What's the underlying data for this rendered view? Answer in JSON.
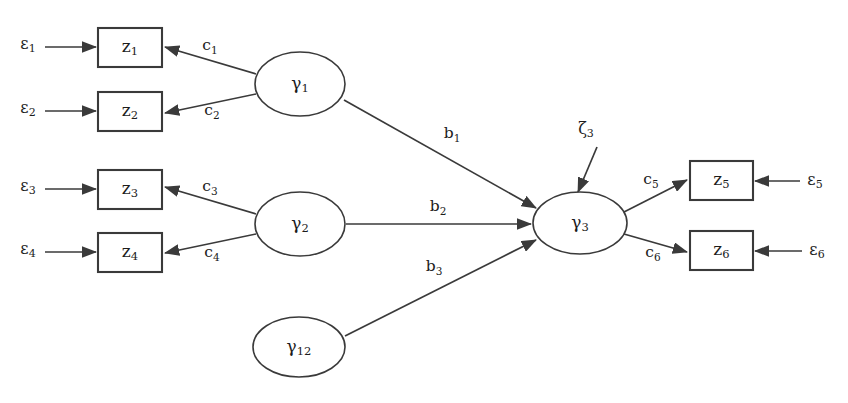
{
  "figure": {
    "type": "path-diagram",
    "model": "structural-equation-model",
    "background_color": "#ffffff",
    "stroke_color": "#3a3a3a",
    "text_color": "#1c1c1c"
  },
  "latent_variables": [
    {
      "id": "gamma1",
      "symbol": "γ",
      "subscript": "1",
      "cx": 300,
      "cy": 84,
      "rx": 45,
      "ry": 32
    },
    {
      "id": "gamma2",
      "symbol": "γ",
      "subscript": "2",
      "cx": 300,
      "cy": 224,
      "rx": 45,
      "ry": 32
    },
    {
      "id": "gamma12",
      "symbol": "γ",
      "subscript": "12",
      "cx": 299,
      "cy": 347,
      "rx": 46,
      "ry": 30
    },
    {
      "id": "gamma3",
      "symbol": "γ",
      "subscript": "3",
      "cx": 580,
      "cy": 223,
      "rx": 47,
      "ry": 31
    }
  ],
  "observed_variables": [
    {
      "id": "z1",
      "symbol": "z",
      "subscript": "1",
      "x": 98,
      "y": 28,
      "w": 64,
      "h": 39
    },
    {
      "id": "z2",
      "symbol": "z",
      "subscript": "2",
      "x": 98,
      "y": 92,
      "w": 64,
      "h": 39
    },
    {
      "id": "z3",
      "symbol": "z",
      "subscript": "3",
      "x": 98,
      "y": 170,
      "w": 64,
      "h": 39
    },
    {
      "id": "z4",
      "symbol": "z",
      "subscript": "4",
      "x": 98,
      "y": 233,
      "w": 64,
      "h": 39
    },
    {
      "id": "z5",
      "symbol": "z",
      "subscript": "5",
      "x": 690,
      "y": 161,
      "w": 63,
      "h": 39
    },
    {
      "id": "z6",
      "symbol": "z",
      "subscript": "6",
      "x": 690,
      "y": 231,
      "w": 63,
      "h": 39
    }
  ],
  "error_terms": [
    {
      "id": "eps1",
      "symbol": "ε",
      "subscript": "1",
      "x": 28,
      "y": 44
    },
    {
      "id": "eps2",
      "symbol": "ε",
      "subscript": "2",
      "x": 28,
      "y": 108
    },
    {
      "id": "eps3",
      "symbol": "ε",
      "subscript": "3",
      "x": 28,
      "y": 186
    },
    {
      "id": "eps4",
      "symbol": "ε",
      "subscript": "4",
      "x": 28,
      "y": 249
    },
    {
      "id": "eps5",
      "symbol": "ε",
      "subscript": "5",
      "x": 815,
      "y": 180
    },
    {
      "id": "eps6",
      "symbol": "ε",
      "subscript": "6",
      "x": 817,
      "y": 250
    }
  ],
  "disturbance_terms": [
    {
      "id": "zeta3",
      "symbol": "ζ",
      "subscript": "3",
      "x": 586,
      "y": 129
    }
  ],
  "loading_labels": [
    {
      "id": "c1",
      "symbol": "c",
      "subscript": "1",
      "x": 210,
      "y": 46,
      "from": "gamma1",
      "to": "z1"
    },
    {
      "id": "c2",
      "symbol": "c",
      "subscript": "2",
      "x": 212,
      "y": 111,
      "from": "gamma1",
      "to": "z2"
    },
    {
      "id": "c3",
      "symbol": "c",
      "subscript": "3",
      "x": 210,
      "y": 187,
      "from": "gamma2",
      "to": "z3"
    },
    {
      "id": "c4",
      "symbol": "c",
      "subscript": "4",
      "x": 212,
      "y": 253,
      "from": "gamma2",
      "to": "z4"
    },
    {
      "id": "c5",
      "symbol": "c",
      "subscript": "5",
      "x": 651,
      "y": 180,
      "from": "gamma3",
      "to": "z5"
    },
    {
      "id": "c6",
      "symbol": "c",
      "subscript": "6",
      "x": 653,
      "y": 253,
      "from": "gamma3",
      "to": "z6"
    }
  ],
  "structural_labels": [
    {
      "id": "b1",
      "symbol": "b",
      "subscript": "1",
      "x": 452,
      "y": 134,
      "from": "gamma1",
      "to": "gamma3"
    },
    {
      "id": "b2",
      "symbol": "b",
      "subscript": "2",
      "x": 438,
      "y": 207,
      "from": "gamma2",
      "to": "gamma3"
    },
    {
      "id": "b3",
      "symbol": "b",
      "subscript": "3",
      "x": 434,
      "y": 267,
      "from": "gamma12",
      "to": "gamma3"
    }
  ],
  "edges": [
    {
      "id": "eps1-to-z1",
      "kind": "error",
      "x1": 45,
      "y1": 47,
      "x2": 96,
      "y2": 47
    },
    {
      "id": "eps2-to-z2",
      "kind": "error",
      "x1": 45,
      "y1": 111,
      "x2": 96,
      "y2": 111
    },
    {
      "id": "eps3-to-z3",
      "kind": "error",
      "x1": 45,
      "y1": 189,
      "x2": 96,
      "y2": 189
    },
    {
      "id": "eps4-to-z4",
      "kind": "error",
      "x1": 45,
      "y1": 252,
      "x2": 96,
      "y2": 252
    },
    {
      "id": "eps5-to-z5",
      "kind": "error",
      "x1": 800,
      "y1": 181,
      "x2": 755,
      "y2": 181
    },
    {
      "id": "eps6-to-z6",
      "kind": "error",
      "x1": 802,
      "y1": 251,
      "x2": 755,
      "y2": 251
    },
    {
      "id": "g1-to-z1",
      "kind": "loading",
      "x1": 256,
      "y1": 74,
      "x2": 165,
      "y2": 47
    },
    {
      "id": "g1-to-z2",
      "kind": "loading",
      "x1": 256,
      "y1": 94,
      "x2": 165,
      "y2": 113
    },
    {
      "id": "g2-to-z3",
      "kind": "loading",
      "x1": 256,
      "y1": 214,
      "x2": 165,
      "y2": 187
    },
    {
      "id": "g2-to-z4",
      "kind": "loading",
      "x1": 256,
      "y1": 234,
      "x2": 165,
      "y2": 253
    },
    {
      "id": "g3-to-z5",
      "kind": "loading",
      "x1": 624,
      "y1": 212,
      "x2": 687,
      "y2": 180
    },
    {
      "id": "g3-to-z6",
      "kind": "loading",
      "x1": 624,
      "y1": 234,
      "x2": 687,
      "y2": 252
    },
    {
      "id": "g1-to-g3",
      "kind": "structural",
      "x1": 344,
      "y1": 100,
      "x2": 536,
      "y2": 208
    },
    {
      "id": "g2-to-g3",
      "kind": "structural",
      "x1": 346,
      "y1": 224,
      "x2": 531,
      "y2": 224
    },
    {
      "id": "g12-to-g3",
      "kind": "structural",
      "x1": 345,
      "y1": 336,
      "x2": 536,
      "y2": 240
    },
    {
      "id": "zeta3-to-g3",
      "kind": "disturbance",
      "x1": 597,
      "y1": 147,
      "x2": 578,
      "y2": 192
    }
  ]
}
